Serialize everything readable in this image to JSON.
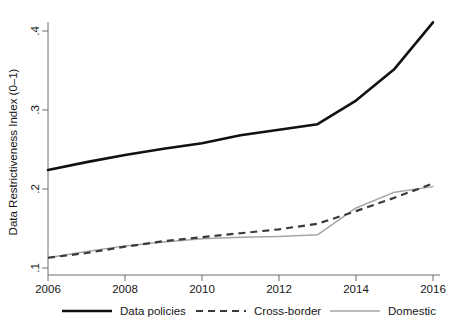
{
  "chart_data": {
    "type": "line",
    "title": "",
    "xlabel": "",
    "ylabel": "Data Restrictiveness Index (0–1)",
    "x": [
      2006,
      2007,
      2008,
      2009,
      2010,
      2011,
      2012,
      2013,
      2014,
      2015,
      2016
    ],
    "xlim": [
      2006,
      2016
    ],
    "ylim": [
      0.1,
      0.42
    ],
    "xticks": [
      2006,
      2008,
      2010,
      2012,
      2014,
      2016
    ],
    "xtick_labels": [
      "2006",
      "2008",
      "2010",
      "2012",
      "2014",
      "2016"
    ],
    "yticks": [
      0.1,
      0.2,
      0.3,
      0.4
    ],
    "ytick_labels": [
      ".1",
      ".2",
      ".3",
      ".4"
    ],
    "grid": false,
    "legend_position": "bottom",
    "series": [
      {
        "name": "Data policies",
        "style": "solid-thick",
        "color": "#111111",
        "values": [
          0.224,
          0.234,
          0.243,
          0.251,
          0.258,
          0.268,
          0.275,
          0.282,
          0.312,
          0.352,
          0.411
        ]
      },
      {
        "name": "Cross-border",
        "style": "dashed",
        "color": "#3a3a3a",
        "values": [
          0.113,
          0.119,
          0.127,
          0.134,
          0.139,
          0.144,
          0.149,
          0.156,
          0.172,
          0.189,
          0.207
        ]
      },
      {
        "name": "Domestic",
        "style": "solid-thin",
        "color": "#a5a5a5",
        "values": [
          0.113,
          0.121,
          0.128,
          0.133,
          0.137,
          0.139,
          0.14,
          0.142,
          0.176,
          0.196,
          0.203
        ]
      }
    ]
  },
  "legend": {
    "items": [
      {
        "label": "Data policies",
        "style": "solid-thick"
      },
      {
        "label": "Cross-border",
        "style": "dashed"
      },
      {
        "label": "Domestic",
        "style": "solid-thin"
      }
    ]
  },
  "caption_sliver": {
    "text": ""
  }
}
